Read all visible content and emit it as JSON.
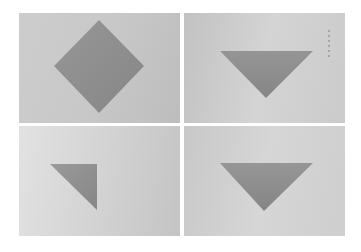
{
  "figure": {
    "layout": "2x2 grid",
    "panels": [
      {
        "id": "top-left",
        "shape": "diamond",
        "description": "square rotated 45 degrees"
      },
      {
        "id": "top-right",
        "shape": "inverted-triangle",
        "description": "downward-pointing triangle"
      },
      {
        "id": "bottom-left",
        "shape": "right-triangle",
        "description": "triangle with right angle at top-right"
      },
      {
        "id": "bottom-right",
        "shape": "inverted-triangle",
        "description": "downward-pointing triangle"
      }
    ],
    "colors": {
      "shape_fill": "#8c8c8c",
      "background": "#cccccc"
    }
  }
}
